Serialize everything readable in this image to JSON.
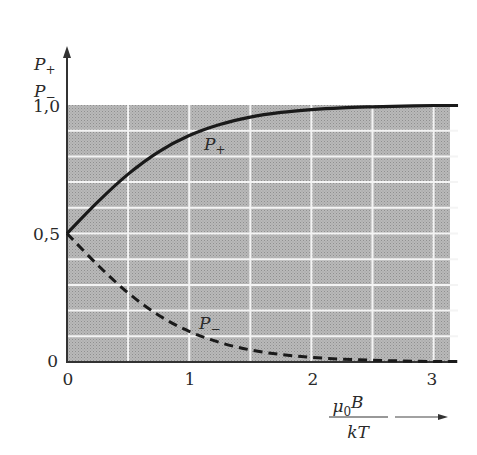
{
  "chart_data": {
    "type": "line",
    "title": "",
    "xlabel": "μ0B / kT",
    "ylabel": "P+ / P−",
    "x_ticks": [
      "0",
      "1",
      "2",
      "3"
    ],
    "y_ticks": [
      "0",
      "0,5",
      "1,0"
    ],
    "xlim": [
      0,
      3.2
    ],
    "ylim": [
      0,
      1.0
    ],
    "grid": true,
    "background": "shaded grey (0..1 region)",
    "x": [
      0,
      0.25,
      0.5,
      0.75,
      1.0,
      1.25,
      1.5,
      1.75,
      2.0,
      2.25,
      2.5,
      2.75,
      3.0,
      3.2
    ],
    "series": [
      {
        "name": "P+",
        "style": "solid",
        "values": [
          0.5,
          0.622,
          0.731,
          0.818,
          0.881,
          0.924,
          0.953,
          0.971,
          0.982,
          0.989,
          0.993,
          0.996,
          0.998,
          0.998
        ]
      },
      {
        "name": "P−",
        "style": "dashed",
        "values": [
          0.5,
          0.378,
          0.269,
          0.182,
          0.119,
          0.076,
          0.047,
          0.029,
          0.018,
          0.011,
          0.007,
          0.004,
          0.002,
          0.002
        ]
      }
    ],
    "annotations": [
      {
        "text": "P+",
        "near": "solid curve at x≈1.2"
      },
      {
        "text": "P−",
        "near": "dashed curve at x≈1.2"
      }
    ],
    "legend": "none (inline curve labels)"
  },
  "labels": {
    "y_axis_top": "P",
    "y_axis_top_sub": "+",
    "y_axis_bottom": "P",
    "y_axis_bottom_sub": "−",
    "y_tick_1": "1,0",
    "y_tick_05": "0,5",
    "y_tick_0": "0",
    "x_tick_0": "0",
    "x_tick_1": "1",
    "x_tick_2": "2",
    "x_tick_3": "3",
    "x_num": "μ",
    "x_num_sub": "0",
    "x_num_B": "B",
    "x_den": "kT",
    "curve_plus": "P",
    "curve_plus_sub": "+",
    "curve_minus": "P",
    "curve_minus_sub": "−"
  }
}
